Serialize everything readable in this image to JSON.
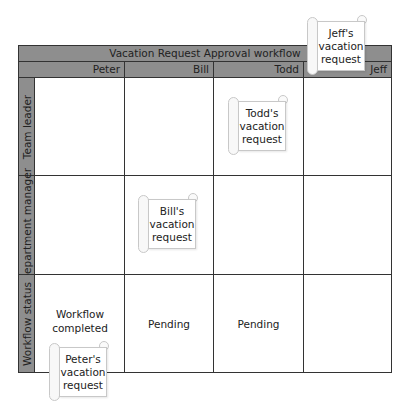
{
  "title": "Vacation Request Approval workflow",
  "columns": [
    "Peter",
    "Bill",
    "Todd",
    "Jeff"
  ],
  "rows": [
    "Team leader",
    "Department manager",
    "Workflow status"
  ],
  "status": {
    "peter": "Workflow completed",
    "bill": "Pending",
    "todd": "Pending",
    "jeff": ""
  },
  "scrolls": {
    "jeff": "Jeff's vacation request",
    "todd": "Todd's vacation request",
    "bill": "Bill's vacation request",
    "peter": "Peter's vacation request"
  },
  "colors": {
    "header": "#8e8e8e",
    "border": "#333333"
  }
}
